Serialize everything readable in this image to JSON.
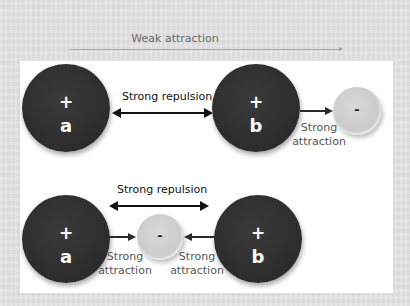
{
  "title": "Weak attraction",
  "top_diagram": {
    "nucleus_a": {
      "charge": "+",
      "label": "a"
    },
    "nucleus_b": {
      "charge": "+",
      "label": "b"
    },
    "electron": {
      "charge": "-"
    },
    "repulsion_label": "Strong repulsion",
    "attraction_label_line1": "Strong",
    "attraction_label_line2": "attraction"
  },
  "bottom_diagram": {
    "nucleus_a": {
      "charge": "+",
      "label": "a"
    },
    "nucleus_b": {
      "charge": "+",
      "label": "b"
    },
    "electron": {
      "charge": "-"
    },
    "repulsion_label": "Strong repulsion",
    "left_attraction_line1": "Strong",
    "left_attraction_line2": "attraction",
    "right_attraction_line1": "Strong",
    "right_attraction_line2": "attraction"
  },
  "colors": {
    "background": "#e2e2e2",
    "panel": "#ffffff",
    "nucleus": "#2e2e2e",
    "electron": "#cacaca",
    "arrow": "#111111",
    "attraction_text": "#555555"
  }
}
